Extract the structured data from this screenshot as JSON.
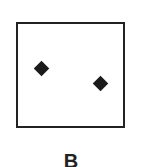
{
  "figure": {
    "label": "B",
    "points": [
      {
        "name": "diamond-1",
        "x": 42,
        "y": 69
      },
      {
        "name": "diamond-2",
        "x": 101,
        "y": 84
      }
    ]
  }
}
